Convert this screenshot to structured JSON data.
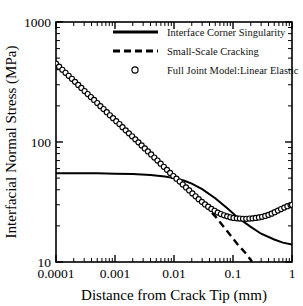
{
  "chart_data": {
    "type": "line",
    "title": "",
    "xlabel": "Distance from Crack Tip (mm)",
    "ylabel": "Interfacial Normal Stress (MPa)",
    "xscale": "log",
    "yscale": "log",
    "xlim": [
      0.0001,
      1
    ],
    "ylim": [
      10,
      1000
    ],
    "xticks": [
      0.0001,
      0.001,
      0.01,
      0.1,
      1
    ],
    "xtick_labels": [
      "0.0001",
      "0.001",
      "0.01",
      "0.1",
      "1"
    ],
    "yticks": [
      10,
      100,
      1000
    ],
    "ytick_labels": [
      "10",
      "100",
      "1000"
    ],
    "grid": false,
    "legend_position": "top-center",
    "series": [
      {
        "name": "Interface Corner Singularity",
        "style": "solid",
        "x": [
          0.0001,
          0.0002,
          0.0005,
          0.001,
          0.002,
          0.004,
          0.007,
          0.01,
          0.015,
          0.02,
          0.03,
          0.05,
          0.08,
          0.12,
          0.2,
          0.3,
          0.5,
          0.7,
          1.0
        ],
        "y": [
          55.0,
          55.0,
          54.8,
          54.5,
          54.0,
          53.0,
          51.5,
          50.0,
          47.5,
          45.0,
          40.5,
          34.0,
          28.0,
          23.5,
          19.6,
          17.2,
          15.4,
          14.5,
          14.0
        ]
      },
      {
        "name": "Small-Scale Cracking",
        "style": "dashed",
        "x": [
          0.012,
          0.015,
          0.02,
          0.03,
          0.05,
          0.08,
          0.12,
          0.16,
          0.2,
          0.21
        ],
        "y": [
          47.0,
          43.5,
          38.5,
          31.5,
          24.0,
          18.0,
          14.0,
          12.0,
          10.4,
          10.0
        ]
      },
      {
        "name": "Full Joint Model:Linear Elastic",
        "style": "markers",
        "marker": "open-circle",
        "x": [
          0.0001,
          0.000113,
          0.000128,
          0.000145,
          0.000164,
          0.000186,
          0.00021,
          0.000238,
          0.000269,
          0.000305,
          0.000345,
          0.00039,
          0.000442,
          0.0005,
          0.000566,
          0.00064,
          0.000725,
          0.00082,
          0.000928,
          0.00105,
          0.00119,
          0.00134,
          0.00152,
          0.00172,
          0.00195,
          0.00221,
          0.0025,
          0.00283,
          0.0032,
          0.00362,
          0.0041,
          0.00464,
          0.00525,
          0.00594,
          0.00672,
          0.0076,
          0.0086,
          0.00974,
          0.011,
          0.0125,
          0.0141,
          0.016,
          0.0181,
          0.0205,
          0.0232,
          0.0262,
          0.0297,
          0.0336,
          0.038,
          0.043,
          0.0487,
          0.0551,
          0.0623,
          0.0705,
          0.0798,
          0.0903,
          0.102,
          0.116,
          0.131,
          0.148,
          0.168,
          0.19,
          0.215,
          0.243,
          0.275,
          0.311,
          0.352,
          0.399,
          0.451,
          0.51,
          0.577,
          0.653,
          0.739,
          0.836,
          0.946,
          1.0
        ],
        "y": [
          450.0,
          424.0,
          400.0,
          377.0,
          356.0,
          336.0,
          317.0,
          299.0,
          282.0,
          266.0,
          251.0,
          237.0,
          224.0,
          211.0,
          199.0,
          188.0,
          177.0,
          167.0,
          158.0,
          149.0,
          141.0,
          133.0,
          125.0,
          118.0,
          111.5,
          105.2,
          99.3,
          93.7,
          88.4,
          83.4,
          78.7,
          74.2,
          70.0,
          66.0,
          62.2,
          58.6,
          55.2,
          52.0,
          49.5,
          46.8,
          44.2,
          41.8,
          39.5,
          37.3,
          35.3,
          33.4,
          31.7,
          30.2,
          28.9,
          27.7,
          26.7,
          25.8,
          25.1,
          24.5,
          24.0,
          23.6,
          23.3,
          23.1,
          23.0,
          22.9,
          22.9,
          23.0,
          23.1,
          23.3,
          23.5,
          23.8,
          24.2,
          24.7,
          25.3,
          26.0,
          26.8,
          27.6,
          28.4,
          29.2,
          29.8,
          30.0
        ]
      }
    ],
    "legend": [
      {
        "label": "Interface Corner Singularity",
        "style": "solid"
      },
      {
        "label": "Small-Scale Cracking",
        "style": "dashed"
      },
      {
        "label": "Full Joint Model:Linear Elastic",
        "style": "open-circle"
      }
    ]
  }
}
